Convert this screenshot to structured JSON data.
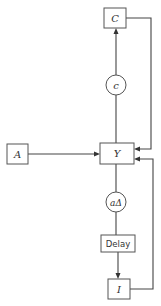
{
  "diagram": {
    "nodes": {
      "C": {
        "label": "C",
        "shape": "box"
      },
      "c": {
        "label": "c",
        "shape": "circle"
      },
      "A": {
        "label": "A",
        "shape": "box"
      },
      "Y": {
        "label": "Y",
        "shape": "box"
      },
      "a_delta": {
        "label": "aΔ",
        "shape": "circle"
      },
      "delay": {
        "label": "Delay",
        "shape": "box"
      },
      "I": {
        "label": "I",
        "shape": "box"
      }
    },
    "edges": [
      {
        "from": "Y",
        "to": "c",
        "via": "line"
      },
      {
        "from": "c",
        "to": "C",
        "arrow": "up"
      },
      {
        "from": "C",
        "to": "Y",
        "arrow": "left",
        "route": "right-loop"
      },
      {
        "from": "A",
        "to": "Y",
        "arrow": "right"
      },
      {
        "from": "Y",
        "to": "a_delta",
        "via": "line"
      },
      {
        "from": "a_delta",
        "to": "delay",
        "via": "line"
      },
      {
        "from": "delay",
        "to": "I",
        "arrow": "down"
      },
      {
        "from": "I",
        "to": "Y",
        "arrow": "left",
        "route": "right-loop"
      }
    ],
    "colors": {
      "stroke": "#444444",
      "text": "#333333",
      "background": "#ffffff"
    }
  }
}
